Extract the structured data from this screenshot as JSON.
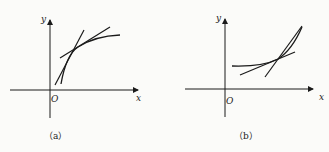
{
  "figures": [
    {
      "id": "a",
      "caption": "（a）",
      "axis_labels": {
        "x": "x",
        "y": "y",
        "origin": "O"
      },
      "description": "concave increasing curve with two tangent lines"
    },
    {
      "id": "b",
      "caption": "（b）",
      "axis_labels": {
        "x": "x",
        "y": "y",
        "origin": "O"
      },
      "description": "convex increasing curve with two tangent lines"
    }
  ],
  "colors": {
    "stroke": "#1a1a1a",
    "background": "#fbfbf9"
  }
}
